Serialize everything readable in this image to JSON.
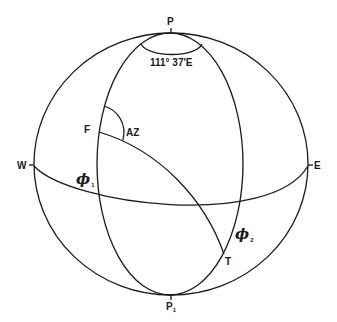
{
  "diagram": {
    "type": "spherical-geometry",
    "line_color": "#1a1a1a",
    "background": "#ffffff",
    "labels": {
      "north_pole": "P",
      "south_pole": "P",
      "south_pole_sub": "1",
      "west": "W",
      "east": "E",
      "from_point": "F",
      "to_point": "T",
      "azimuth": "AZ",
      "longitude_difference": "111° 37'E",
      "phi1": "ϕ",
      "phi1_sub": "1",
      "phi2": "ϕ",
      "phi2_sub": "2"
    },
    "elements": [
      {
        "name": "outer-sphere",
        "shape": "ellipse"
      },
      {
        "name": "meridian-through-F-and-T",
        "shape": "ellipse"
      },
      {
        "name": "equator",
        "shape": "front-arc"
      },
      {
        "name": "polar-angle-arc",
        "shape": "small-ellipse"
      },
      {
        "name": "great-circle-path-F-to-T",
        "shape": "arc"
      },
      {
        "name": "azimuth-arc",
        "shape": "arc"
      }
    ]
  }
}
